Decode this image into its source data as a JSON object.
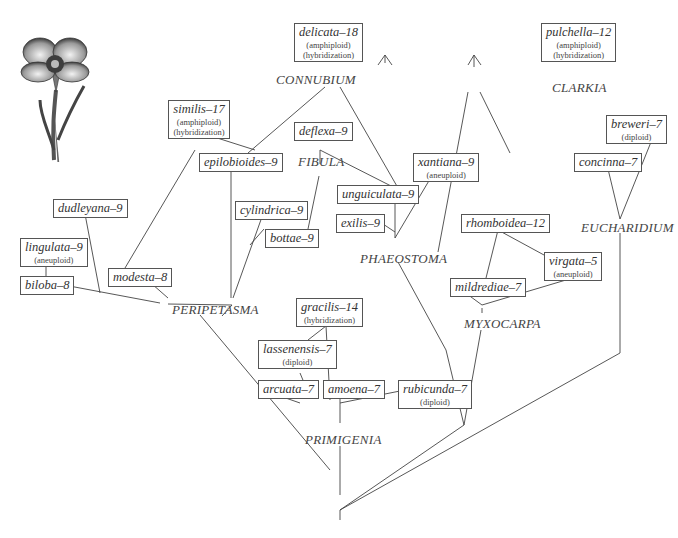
{
  "illustration": {
    "name": "clarkia-flower-illustration"
  },
  "sections": [
    {
      "id": "connubium",
      "label": "CONNUBIUM",
      "x": 276,
      "y": 72
    },
    {
      "id": "fibula",
      "label": "FIBULA",
      "x": 298,
      "y": 154
    },
    {
      "id": "clarkia",
      "label": "CLARKIA",
      "x": 552,
      "y": 80
    },
    {
      "id": "eucharidium",
      "label": "EUCHARIDIUM",
      "x": 581,
      "y": 220
    },
    {
      "id": "phaeostoma",
      "label": "PHAEOSTOMA",
      "x": 360,
      "y": 251
    },
    {
      "id": "peripetasma",
      "label": "PERIPETASMA",
      "x": 172,
      "y": 302
    },
    {
      "id": "myxocarpa",
      "label": "MYXOCARPA",
      "x": 464,
      "y": 316
    },
    {
      "id": "primigenia",
      "label": "PRIMIGENIA",
      "x": 305,
      "y": 432
    }
  ],
  "species": [
    {
      "id": "delicata",
      "name": "delicata–18",
      "notes": [
        "(amphiploid)",
        "(hybridization)"
      ],
      "x": 294,
      "y": 23,
      "w": 64
    },
    {
      "id": "pulchella",
      "name": "pulchella–12",
      "notes": [
        "(amphiploid)",
        "(hybridization)"
      ],
      "x": 541,
      "y": 23,
      "w": 68
    },
    {
      "id": "similis",
      "name": "similis–17",
      "notes": [
        "(amphiploid)",
        "(hybridization)"
      ],
      "x": 168,
      "y": 100,
      "w": 62
    },
    {
      "id": "deflexa",
      "name": "deflexa–9",
      "notes": [],
      "x": 294,
      "y": 122,
      "w": 50
    },
    {
      "id": "breweri",
      "name": "breweri–7",
      "notes": [
        "(diploid)"
      ],
      "x": 606,
      "y": 115,
      "w": 52
    },
    {
      "id": "epilobioides",
      "name": "epilobioides–9",
      "notes": [],
      "x": 199,
      "y": 153,
      "w": 74
    },
    {
      "id": "concinna",
      "name": "concinna–7",
      "notes": [],
      "x": 574,
      "y": 153,
      "w": 60
    },
    {
      "id": "xantiana",
      "name": "xantiana–9",
      "notes": [
        "(aneuploid)"
      ],
      "x": 413,
      "y": 153,
      "w": 56
    },
    {
      "id": "dudleyana",
      "name": "dudleyana–9",
      "notes": [],
      "x": 53,
      "y": 199,
      "w": 66
    },
    {
      "id": "cylindrica",
      "name": "cylindrica–9",
      "notes": [],
      "x": 235,
      "y": 201,
      "w": 64
    },
    {
      "id": "unguiculata",
      "name": "unguiculata–9",
      "notes": [],
      "x": 337,
      "y": 185,
      "w": 80
    },
    {
      "id": "exilis",
      "name": "exilis–9",
      "notes": [],
      "x": 336,
      "y": 214,
      "w": 44
    },
    {
      "id": "bottae",
      "name": "bottae–9",
      "notes": [],
      "x": 265,
      "y": 229,
      "w": 52
    },
    {
      "id": "lingulata",
      "name": "lingulata–9",
      "notes": [
        "(aneuploid)"
      ],
      "x": 20,
      "y": 238,
      "w": 60
    },
    {
      "id": "rhomboidea",
      "name": "rhomboidea–12",
      "notes": [],
      "x": 461,
      "y": 214,
      "w": 72
    },
    {
      "id": "virgata",
      "name": "virgata–5",
      "notes": [
        "(aneuploid)"
      ],
      "x": 544,
      "y": 252,
      "w": 52
    },
    {
      "id": "mildrediae",
      "name": "mildrediae–7",
      "notes": [],
      "x": 450,
      "y": 278,
      "w": 64
    },
    {
      "id": "modesta",
      "name": "modesta–8",
      "notes": [],
      "x": 108,
      "y": 268,
      "w": 58
    },
    {
      "id": "biloba",
      "name": "biloba–8",
      "notes": [],
      "x": 20,
      "y": 276,
      "w": 48
    },
    {
      "id": "gracilis",
      "name": "gracilis–14",
      "notes": [
        "(hybridization)"
      ],
      "x": 296,
      "y": 298,
      "w": 60
    },
    {
      "id": "lassenensis",
      "name": "lassenensis–7",
      "notes": [
        "(diploid)"
      ],
      "x": 258,
      "y": 340,
      "w": 66
    },
    {
      "id": "arcuata",
      "name": "arcuata–7",
      "notes": [],
      "x": 258,
      "y": 380,
      "w": 52
    },
    {
      "id": "amoena",
      "name": "amoena–7",
      "notes": [],
      "x": 323,
      "y": 380,
      "w": 52
    },
    {
      "id": "rubicunda",
      "name": "rubicunda–7",
      "notes": [
        "(diploid)"
      ],
      "x": 398,
      "y": 380,
      "w": 64
    }
  ],
  "edges": [
    [
      385,
      55,
      385,
      63
    ],
    [
      385,
      55,
      378,
      65
    ],
    [
      385,
      55,
      392,
      65
    ],
    [
      325,
      87,
      248,
      153
    ],
    [
      340,
      87,
      398,
      188
    ],
    [
      320,
      150,
      320,
      164
    ],
    [
      320,
      150,
      395,
      188
    ],
    [
      319,
      176,
      308,
      229
    ],
    [
      474,
      55,
      474,
      67
    ],
    [
      474,
      55,
      468,
      65
    ],
    [
      474,
      55,
      481,
      65
    ],
    [
      468,
      92,
      438,
      252
    ],
    [
      480,
      92,
      510,
      153
    ],
    [
      651,
      142,
      620,
      219
    ],
    [
      608,
      169,
      620,
      219
    ],
    [
      620,
      219,
      620,
      219
    ],
    [
      620,
      233,
      620,
      353
    ],
    [
      620,
      353,
      340,
      510
    ],
    [
      192,
      130,
      255,
      150
    ],
    [
      195,
      150,
      125,
      268
    ],
    [
      231,
      170,
      231,
      298
    ],
    [
      263,
      214,
      233,
      298
    ],
    [
      264,
      229,
      250,
      245
    ],
    [
      46,
      262,
      46,
      276
    ],
    [
      64,
      285,
      160,
      303
    ],
    [
      85,
      214,
      100,
      293
    ],
    [
      152,
      284,
      168,
      298
    ],
    [
      395,
      196,
      395,
      238
    ],
    [
      380,
      222,
      395,
      232
    ],
    [
      430,
      179,
      395,
      238
    ],
    [
      398,
      262,
      446,
      350
    ],
    [
      498,
      230,
      486,
      278
    ],
    [
      498,
      230,
      544,
      255
    ],
    [
      467,
      294,
      482,
      305
    ],
    [
      576,
      277,
      482,
      305
    ],
    [
      482,
      308,
      482,
      313
    ],
    [
      481,
      330,
      464,
      425
    ],
    [
      168,
      304,
      232,
      305
    ],
    [
      200,
      315,
      330,
      470
    ],
    [
      232,
      305,
      222,
      316
    ],
    [
      326,
      326,
      330,
      400
    ],
    [
      308,
      340,
      326,
      326
    ],
    [
      300,
      373,
      310,
      397
    ],
    [
      280,
      396,
      300,
      403
    ],
    [
      340,
      396,
      340,
      405
    ],
    [
      400,
      391,
      340,
      403
    ],
    [
      340,
      405,
      340,
      423
    ],
    [
      340,
      446,
      340,
      495
    ],
    [
      340,
      510,
      340,
      520
    ],
    [
      464,
      425,
      340,
      510
    ],
    [
      446,
      350,
      464,
      425
    ]
  ]
}
